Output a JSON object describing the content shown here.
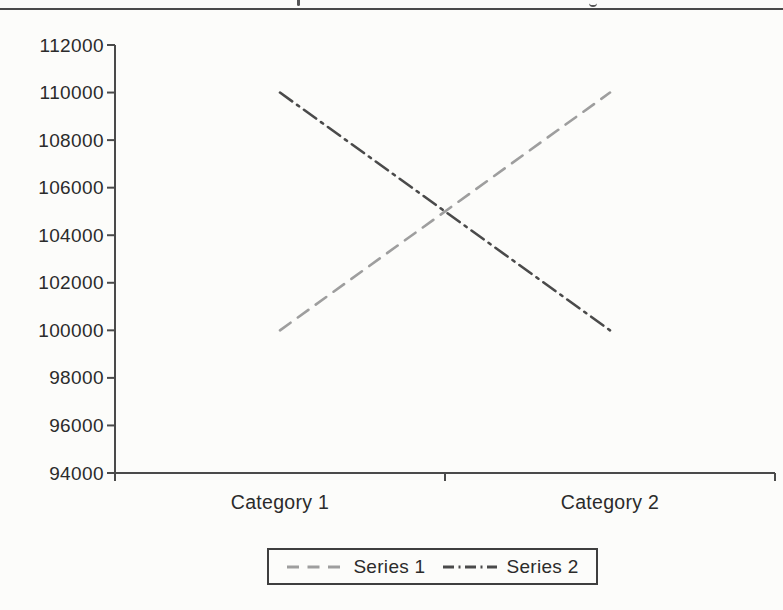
{
  "page": {
    "background": "#fcfcfa",
    "header_rule_visible": true
  },
  "chart_data": {
    "type": "line",
    "title": "",
    "xlabel": "",
    "ylabel": "",
    "categories": [
      "Category 1",
      "Category 2"
    ],
    "series": [
      {
        "name": "Series 1",
        "values": [
          100000,
          110000
        ],
        "color": "#9e9e9e",
        "dash_style": "dashed"
      },
      {
        "name": "Series 2",
        "values": [
          110000,
          100000
        ],
        "color": "#4a4a4a",
        "dash_style": "dash-dot"
      }
    ],
    "ylim": [
      94000,
      112000
    ],
    "ytick_step": 2000,
    "ytick_labels": [
      "94000",
      "96000",
      "98000",
      "100000",
      "102000",
      "104000",
      "106000",
      "108000",
      "110000",
      "112000"
    ],
    "grid": false,
    "legend_position": "bottom-center",
    "axis_color": "#4a4a4a",
    "text_color": "#2b2b2b"
  },
  "legend": {
    "items": [
      {
        "label": "Series 1"
      },
      {
        "label": "Series 2"
      }
    ]
  }
}
